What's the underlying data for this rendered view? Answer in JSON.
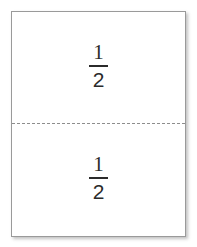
{
  "figure": {
    "name": "fraction-area-model",
    "whole_label": "",
    "background_color": "#ffffff",
    "shape_fill": "#ffffff",
    "border_color": "#9a9a9a",
    "divider_color": "#8d8d8d",
    "text_color": "#2b2b2b",
    "divider_style": "dashed",
    "orientation": "horizontal-split",
    "parts": [
      {
        "id": "top",
        "numerator": "1",
        "denominator": "2",
        "label": "1/2"
      },
      {
        "id": "bottom",
        "numerator": "1",
        "denominator": "2",
        "label": "1/2"
      }
    ]
  },
  "chart_data": {
    "type": "bar",
    "title": "",
    "xlabel": "",
    "ylabel": "",
    "categories": [
      "1/2",
      "1/2"
    ],
    "values": [
      0.5,
      0.5
    ],
    "ylim": [
      0,
      1
    ],
    "grid": false,
    "legend": "none",
    "annotations": [
      "1/2",
      "1/2"
    ]
  }
}
